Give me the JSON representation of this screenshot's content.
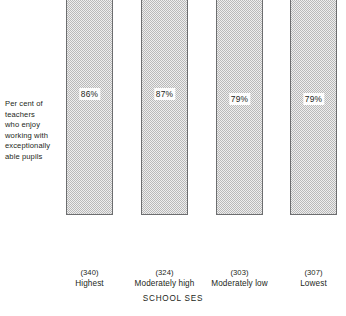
{
  "chart_data": {
    "type": "bar",
    "title": "",
    "xlabel": "SCHOOL SES",
    "ylabel": "Per cent of teachers who enjoy working with exceptionally able pupils",
    "categories": [
      "Highest",
      "Moderately high",
      "Moderately low",
      "Lowest"
    ],
    "values": [
      86,
      87,
      79,
      79
    ],
    "value_labels": [
      "86%",
      "87%",
      "79%",
      "79%"
    ],
    "sample_sizes": [
      "(340)",
      "(324)",
      "(303)",
      "(307)"
    ],
    "ylim": [
      0,
      91
    ],
    "grid": false,
    "legend": null,
    "series": [
      {
        "name": "Per cent of teachers who enjoy working with exceptionally able pupils",
        "values": [
          86,
          87,
          79,
          79
        ]
      }
    ]
  },
  "axis": {
    "y_caption_lines": [
      "Per cent of",
      "teachers",
      "who enjoy",
      "working with",
      "exceptionally",
      "able pupils"
    ],
    "x_title": "SCHOOL SES"
  },
  "bars": [
    {
      "category": "Highest",
      "sample_size": "(340)",
      "value": 86,
      "value_label": "86%",
      "left_px": 66,
      "top_px": 11,
      "height_px": 254,
      "label_top_px": 126
    },
    {
      "category": "Moderately high",
      "sample_size": "(324)",
      "value": 87,
      "value_label": "87%",
      "left_px": 141,
      "top_px": 6,
      "height_px": 259,
      "label_top_px": 131
    },
    {
      "category": "Moderately low",
      "sample_size": "(303)",
      "value": 79,
      "value_label": "79%",
      "left_px": 216,
      "top_px": 31,
      "height_px": 234,
      "label_top_px": 111
    },
    {
      "category": "Lowest",
      "sample_size": "(307)",
      "value": 79,
      "value_label": "79%",
      "left_px": 290,
      "top_px": 31,
      "height_px": 234,
      "label_top_px": 111
    }
  ],
  "colors": {
    "bar_fill_light": "#eeeeee",
    "bar_fill_dark": "#b9b9b9",
    "bar_border": "#6d6e70",
    "text": "#231f20",
    "background": "#ffffff"
  }
}
